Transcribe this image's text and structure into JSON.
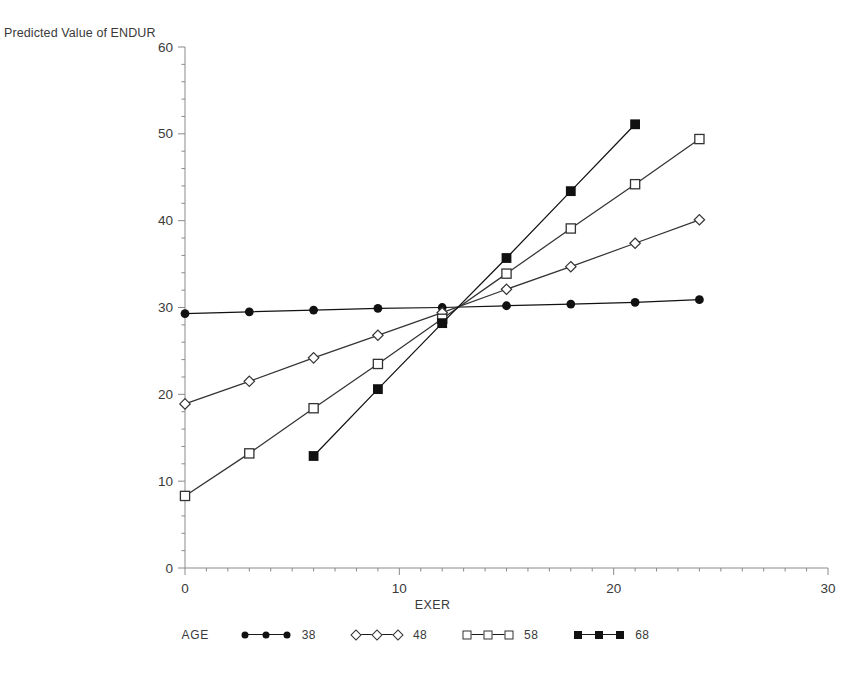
{
  "figure": {
    "ghost_header": "",
    "y_axis_caption": "Predicted Value of ENDUR",
    "x_axis_caption": "EXER",
    "legend_title": "AGE"
  },
  "chart_data": {
    "type": "line",
    "title": "",
    "subtitle": "",
    "xlabel": "EXER",
    "ylabel": "Predicted Value of ENDUR",
    "xlim": [
      0,
      30
    ],
    "ylim": [
      0,
      60
    ],
    "xticks": [
      0,
      10,
      20,
      30
    ],
    "yticks": [
      0,
      10,
      20,
      30,
      40,
      50,
      60
    ],
    "xtick_labels": [
      "0",
      "10",
      "20",
      "30"
    ],
    "ytick_labels": [
      "0",
      "10",
      "20",
      "30",
      "40",
      "50",
      "60"
    ],
    "minor_ticks": true,
    "grid": false,
    "legend_title": "AGE",
    "legend_position": "bottom",
    "series": [
      {
        "name": "38",
        "marker": "filled-circle",
        "color": "#111111",
        "x": [
          0,
          3,
          6,
          9,
          12,
          15,
          18,
          21,
          24
        ],
        "y": [
          29.3,
          29.5,
          29.7,
          29.9,
          30.0,
          30.2,
          30.4,
          30.6,
          30.9
        ]
      },
      {
        "name": "48",
        "marker": "open-diamond",
        "color": "#333333",
        "x": [
          0,
          3,
          6,
          9,
          12,
          15,
          18,
          21,
          24
        ],
        "y": [
          18.9,
          21.5,
          24.2,
          26.8,
          29.4,
          32.1,
          34.7,
          37.4,
          40.1
        ]
      },
      {
        "name": "58",
        "marker": "open-square",
        "color": "#333333",
        "x": [
          0,
          3,
          6,
          9,
          12,
          15,
          18,
          21,
          24
        ],
        "y": [
          8.3,
          13.2,
          18.4,
          23.5,
          28.7,
          33.9,
          39.1,
          44.2,
          49.4
        ]
      },
      {
        "name": "68",
        "marker": "filled-square",
        "color": "#111111",
        "x": [
          6,
          9,
          12,
          15,
          18,
          21
        ],
        "y": [
          12.9,
          20.6,
          28.2,
          35.7,
          43.4,
          51.1
        ]
      }
    ],
    "annotations": [
      "All four fitted lines converge near EXER = 12.5, ENDUR = 29.5"
    ]
  }
}
